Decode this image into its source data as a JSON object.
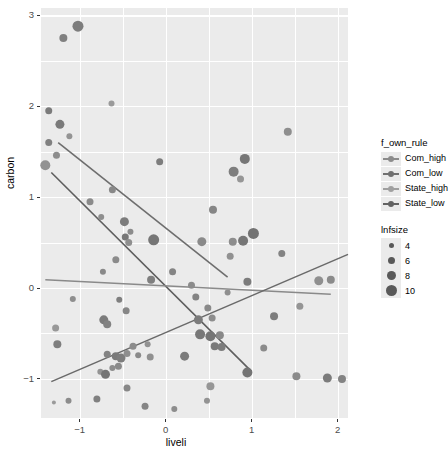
{
  "chart_data": {
    "type": "scatter",
    "title": "",
    "xlabel": "liveli",
    "ylabel": "carbon",
    "xlim": [
      -1.45,
      2.12
    ],
    "ylim": [
      -1.43,
      3.08
    ],
    "xticks": [
      -1,
      0,
      1,
      2
    ],
    "xticklabels": [
      "−1",
      "0",
      "1",
      "2"
    ],
    "yticks": [
      -1,
      0,
      1,
      2,
      3
    ],
    "yticklabels": [
      "−1",
      "0",
      "1",
      "2",
      "3"
    ],
    "grid": true,
    "panel_background": "#ebebeb",
    "grid_color": "#ffffff",
    "legend_position": "right",
    "color_legend": {
      "title": "f_own_rule",
      "entries": [
        {
          "label": "Com_high",
          "color": "#8c8c8c"
        },
        {
          "label": "Com_low",
          "color": "#707070"
        },
        {
          "label": "State_high",
          "color": "#a0a0a0"
        },
        {
          "label": "State_low",
          "color": "#626262"
        }
      ]
    },
    "size_legend": {
      "title": "lnfsize",
      "entries": [
        {
          "label": "4",
          "diameter": 5
        },
        {
          "label": "6",
          "diameter": 7
        },
        {
          "label": "8",
          "diameter": 9
        },
        {
          "label": "10",
          "diameter": 11
        }
      ]
    },
    "fit_lines": [
      {
        "name": "Com_high",
        "color": "#6e6e6e",
        "width": 1.6,
        "x0": -1.25,
        "y0": 1.6,
        "x1": 0.72,
        "y1": 0.12
      },
      {
        "name": "Com_low",
        "color": "#5e5e5e",
        "width": 1.6,
        "x0": -1.33,
        "y0": 1.27,
        "x1": 1.0,
        "y1": -0.92
      },
      {
        "name": "State_high",
        "color": "#8a8a8a",
        "width": 1.5,
        "x0": -1.4,
        "y0": 0.09,
        "x1": 1.92,
        "y1": -0.07
      },
      {
        "name": "State_low",
        "color": "#6a6a6a",
        "width": 1.6,
        "x0": -1.33,
        "y0": -1.03,
        "x1": 2.12,
        "y1": 0.37
      }
    ],
    "points": [
      {
        "x": -1.02,
        "y": 2.88,
        "d": 11,
        "c": "#7d7d7d"
      },
      {
        "x": -1.19,
        "y": 2.75,
        "d": 8,
        "c": "#808080"
      },
      {
        "x": -0.63,
        "y": 2.03,
        "d": 6,
        "c": "#9a9a9a"
      },
      {
        "x": -1.36,
        "y": 1.95,
        "d": 7,
        "c": "#7b7b7b"
      },
      {
        "x": -1.23,
        "y": 1.8,
        "d": 9,
        "c": "#7a7a7a"
      },
      {
        "x": -1.12,
        "y": 1.67,
        "d": 6,
        "c": "#949494"
      },
      {
        "x": -1.36,
        "y": 1.6,
        "d": 7,
        "c": "#818181"
      },
      {
        "x": 1.42,
        "y": 1.72,
        "d": 8,
        "c": "#8e8e8e"
      },
      {
        "x": -1.27,
        "y": 1.46,
        "d": 7,
        "c": "#8d8d8d"
      },
      {
        "x": -1.4,
        "y": 1.35,
        "d": 10,
        "c": "#929292"
      },
      {
        "x": -0.07,
        "y": 1.39,
        "d": 7,
        "c": "#7d7d7d"
      },
      {
        "x": 0.79,
        "y": 1.28,
        "d": 10,
        "c": "#7e7e7e"
      },
      {
        "x": 0.92,
        "y": 1.42,
        "d": 10,
        "c": "#767676"
      },
      {
        "x": 0.87,
        "y": 1.2,
        "d": 7,
        "c": "#969696"
      },
      {
        "x": -0.62,
        "y": 1.08,
        "d": 7,
        "c": "#888888"
      },
      {
        "x": -0.48,
        "y": 0.73,
        "d": 9,
        "c": "#7c7c7c"
      },
      {
        "x": -0.41,
        "y": 0.62,
        "d": 6,
        "c": "#8c8c8c"
      },
      {
        "x": -0.47,
        "y": 0.56,
        "d": 7,
        "c": "#777777"
      },
      {
        "x": -0.43,
        "y": 0.5,
        "d": 7,
        "c": "#8f8f8f"
      },
      {
        "x": 0.55,
        "y": 0.86,
        "d": 8,
        "c": "#858585"
      },
      {
        "x": -0.14,
        "y": 0.53,
        "d": 11,
        "c": "#767676"
      },
      {
        "x": 0.42,
        "y": 0.51,
        "d": 9,
        "c": "#8a8a8a"
      },
      {
        "x": 0.78,
        "y": 0.51,
        "d": 8,
        "c": "#8d8d8d"
      },
      {
        "x": 0.9,
        "y": 0.52,
        "d": 10,
        "c": "#767676"
      },
      {
        "x": 1.02,
        "y": 0.6,
        "d": 11,
        "c": "#727272"
      },
      {
        "x": 0.75,
        "y": 0.35,
        "d": 7,
        "c": "#919191"
      },
      {
        "x": -0.58,
        "y": 0.31,
        "d": 7,
        "c": "#8b8b8b"
      },
      {
        "x": -0.73,
        "y": 0.18,
        "d": 6,
        "c": "#898989"
      },
      {
        "x": -0.17,
        "y": 0.09,
        "d": 8,
        "c": "#7f7f7f"
      },
      {
        "x": 0.3,
        "y": 0.03,
        "d": 7,
        "c": "#8b8b8b"
      },
      {
        "x": 0.95,
        "y": 0.07,
        "d": 8,
        "c": "#7c7c7c"
      },
      {
        "x": 1.78,
        "y": 0.08,
        "d": 9,
        "c": "#8f8f8f"
      },
      {
        "x": 1.92,
        "y": 0.09,
        "d": 8,
        "c": "#8b8b8b"
      },
      {
        "x": -1.08,
        "y": -0.12,
        "d": 6,
        "c": "#8e8e8e"
      },
      {
        "x": -0.54,
        "y": -0.13,
        "d": 6,
        "c": "#7f7f7f"
      },
      {
        "x": -0.46,
        "y": -0.25,
        "d": 7,
        "c": "#868686"
      },
      {
        "x": 0.35,
        "y": -0.1,
        "d": 7,
        "c": "#838383"
      },
      {
        "x": 0.49,
        "y": -0.22,
        "d": 7,
        "c": "#8a8a8a"
      },
      {
        "x": 1.56,
        "y": -0.2,
        "d": 7,
        "c": "#959595"
      },
      {
        "x": -0.72,
        "y": -0.35,
        "d": 9,
        "c": "#7b7b7b"
      },
      {
        "x": -0.68,
        "y": -0.4,
        "d": 8,
        "c": "#828282"
      },
      {
        "x": 0.38,
        "y": -0.35,
        "d": 9,
        "c": "#7b7b7b"
      },
      {
        "x": 0.54,
        "y": -0.33,
        "d": 7,
        "c": "#8d8d8d"
      },
      {
        "x": 1.26,
        "y": -0.31,
        "d": 8,
        "c": "#7d7d7d"
      },
      {
        "x": -1.28,
        "y": -0.44,
        "d": 7,
        "c": "#989898"
      },
      {
        "x": 0.4,
        "y": -0.51,
        "d": 10,
        "c": "#787878"
      },
      {
        "x": 0.52,
        "y": -0.53,
        "d": 10,
        "c": "#757575"
      },
      {
        "x": 0.63,
        "y": -0.52,
        "d": 8,
        "c": "#888888"
      },
      {
        "x": -1.26,
        "y": -0.62,
        "d": 8,
        "c": "#7e7e7e"
      },
      {
        "x": -0.38,
        "y": -0.64,
        "d": 7,
        "c": "#8c8c8c"
      },
      {
        "x": -0.21,
        "y": -0.62,
        "d": 6,
        "c": "#929292"
      },
      {
        "x": 0.57,
        "y": -0.64,
        "d": 8,
        "c": "#797979"
      },
      {
        "x": 0.65,
        "y": -0.65,
        "d": 8,
        "c": "#7c7c7c"
      },
      {
        "x": 1.14,
        "y": -0.66,
        "d": 7,
        "c": "#8b8b8b"
      },
      {
        "x": -0.68,
        "y": -0.73,
        "d": 7,
        "c": "#838383"
      },
      {
        "x": -0.58,
        "y": -0.75,
        "d": 8,
        "c": "#7a7a7a"
      },
      {
        "x": -0.52,
        "y": -0.77,
        "d": 9,
        "c": "#7d7d7d"
      },
      {
        "x": -0.45,
        "y": -0.72,
        "d": 7,
        "c": "#8e8e8e"
      },
      {
        "x": -0.32,
        "y": -0.74,
        "d": 6,
        "c": "#8a8a8a"
      },
      {
        "x": -0.18,
        "y": -0.76,
        "d": 7,
        "c": "#909090"
      },
      {
        "x": 0.22,
        "y": -0.75,
        "d": 9,
        "c": "#7b7b7b"
      },
      {
        "x": -0.62,
        "y": -0.88,
        "d": 6,
        "c": "#8d8d8d"
      },
      {
        "x": -0.55,
        "y": -0.86,
        "d": 7,
        "c": "#8a8a8a"
      },
      {
        "x": -0.76,
        "y": -0.92,
        "d": 6,
        "c": "#949494"
      },
      {
        "x": -0.7,
        "y": -0.95,
        "d": 9,
        "c": "#757575"
      },
      {
        "x": 0.95,
        "y": -0.93,
        "d": 10,
        "c": "#747474"
      },
      {
        "x": 1.52,
        "y": -0.97,
        "d": 8,
        "c": "#8b8b8b"
      },
      {
        "x": 1.88,
        "y": -0.99,
        "d": 9,
        "c": "#7b7b7b"
      },
      {
        "x": 2.05,
        "y": -1.0,
        "d": 8,
        "c": "#838383"
      },
      {
        "x": -0.45,
        "y": -1.1,
        "d": 7,
        "c": "#888888"
      },
      {
        "x": 0.52,
        "y": -1.08,
        "d": 8,
        "c": "#969696"
      },
      {
        "x": -1.3,
        "y": -1.26,
        "d": 4,
        "c": "#9a9a9a"
      },
      {
        "x": -1.13,
        "y": -1.24,
        "d": 6,
        "c": "#8c8c8c"
      },
      {
        "x": -0.8,
        "y": -1.22,
        "d": 7,
        "c": "#808080"
      },
      {
        "x": -0.24,
        "y": -1.3,
        "d": 7,
        "c": "#858585"
      },
      {
        "x": 0.1,
        "y": -1.33,
        "d": 6,
        "c": "#8d8d8d"
      },
      {
        "x": 0.48,
        "y": -1.24,
        "d": 6,
        "c": "#939393"
      },
      {
        "x": -0.88,
        "y": 0.95,
        "d": 7,
        "c": "#8b8b8b"
      },
      {
        "x": -0.75,
        "y": 0.78,
        "d": 6,
        "c": "#8e8e8e"
      },
      {
        "x": 0.08,
        "y": 0.18,
        "d": 7,
        "c": "#848484"
      },
      {
        "x": 0.72,
        "y": -0.05,
        "d": 6,
        "c": "#8f8f8f"
      },
      {
        "x": 1.35,
        "y": 0.38,
        "d": 7,
        "c": "#838383"
      }
    ]
  }
}
